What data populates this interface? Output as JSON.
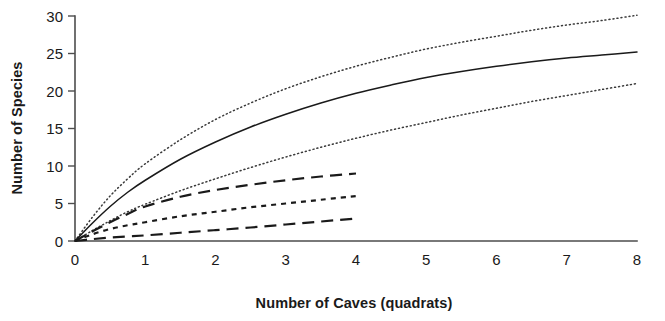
{
  "chart_data": {
    "type": "line",
    "title": "",
    "subtitle": "",
    "xlabel": "Number of Caves (quadrats)",
    "ylabel": "Number of Species",
    "xlim": [
      0,
      8
    ],
    "ylim": [
      0,
      30
    ],
    "xticks": [
      "0",
      "1",
      "2",
      "3",
      "4",
      "5",
      "6",
      "7",
      "8"
    ],
    "yticks": [
      "0",
      "5",
      "10",
      "15",
      "20",
      "25",
      "30"
    ],
    "grid": false,
    "legend": "none",
    "annotations": [],
    "series": [
      {
        "name": "upper-confidence-band",
        "style": "dotted",
        "x": [
          0,
          0.25,
          0.5,
          0.75,
          1,
          1.5,
          2,
          2.5,
          3,
          3.5,
          4,
          4.5,
          5,
          5.5,
          6,
          6.5,
          7,
          7.5,
          8
        ],
        "values": [
          0,
          3.2,
          6.0,
          8.3,
          10.3,
          13.5,
          16.2,
          18.4,
          20.3,
          21.9,
          23.3,
          24.5,
          25.6,
          26.5,
          27.3,
          28.1,
          28.8,
          29.4,
          30.1
        ]
      },
      {
        "name": "mean-species-accumulation",
        "style": "solid",
        "x": [
          0,
          0.25,
          0.5,
          0.75,
          1,
          1.5,
          2,
          2.5,
          3,
          3.5,
          4,
          4.5,
          5,
          5.5,
          6,
          6.5,
          7,
          7.5,
          8
        ],
        "values": [
          0,
          2.4,
          4.6,
          6.5,
          8.1,
          10.9,
          13.2,
          15.2,
          16.9,
          18.4,
          19.7,
          20.8,
          21.8,
          22.6,
          23.3,
          23.9,
          24.4,
          24.8,
          25.2
        ]
      },
      {
        "name": "lower-confidence-band",
        "style": "dotted",
        "x": [
          0,
          0.25,
          0.5,
          0.75,
          1,
          1.5,
          2,
          2.5,
          3,
          3.5,
          4,
          4.5,
          5,
          5.5,
          6,
          6.5,
          7,
          7.5,
          8
        ],
        "values": [
          0,
          1.4,
          2.7,
          3.9,
          4.9,
          6.7,
          8.3,
          9.8,
          11.2,
          12.5,
          13.7,
          14.8,
          15.8,
          16.8,
          17.7,
          18.6,
          19.4,
          20.2,
          21.0
        ]
      },
      {
        "name": "long-dash-upper-curve",
        "style": "long-dash",
        "x": [
          0,
          0.25,
          0.5,
          0.75,
          1,
          1.5,
          2,
          2.5,
          3,
          3.5,
          4
        ],
        "values": [
          0,
          1.3,
          2.5,
          3.6,
          4.6,
          5.9,
          6.8,
          7.5,
          8.1,
          8.6,
          9.0
        ]
      },
      {
        "name": "short-dash-middle-curve",
        "style": "short-dash",
        "x": [
          0,
          0.25,
          0.5,
          0.75,
          1,
          1.5,
          2,
          2.5,
          3,
          3.5,
          4
        ],
        "values": [
          0,
          0.9,
          1.6,
          2.1,
          2.5,
          3.3,
          3.9,
          4.5,
          5.0,
          5.5,
          6.0
        ]
      },
      {
        "name": "long-dash-lower-curve",
        "style": "long-dash",
        "x": [
          0,
          0.25,
          0.5,
          0.75,
          1,
          1.5,
          2,
          2.5,
          3,
          3.5,
          4
        ],
        "values": [
          0,
          0.25,
          0.45,
          0.6,
          0.75,
          1.1,
          1.45,
          1.8,
          2.2,
          2.6,
          3.0
        ]
      }
    ]
  },
  "axes": {
    "x_title": "Number of Caves (quadrats)",
    "y_title": "Number of Species"
  }
}
